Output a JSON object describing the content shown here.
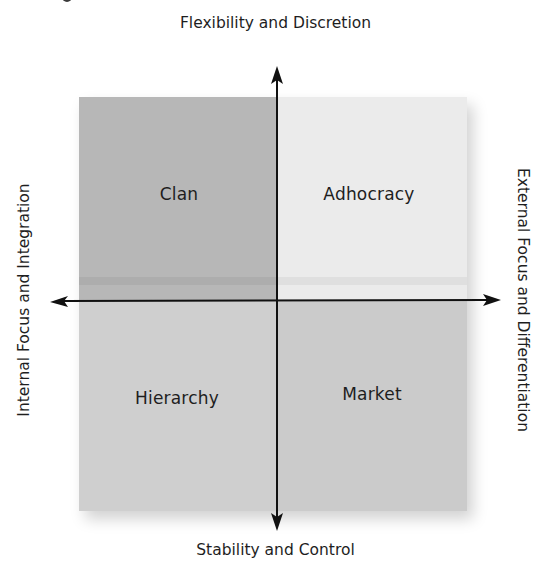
{
  "diagram": {
    "axes": {
      "top": "Flexibility and Discretion",
      "bottom": "Stability and Control",
      "left": "Internal Focus and Integration",
      "right": "External Focus and Differentiation"
    },
    "quadrants": {
      "top_left": {
        "label": "Clan",
        "color": "#b7b7b7"
      },
      "top_right": {
        "label": "Adhocracy",
        "color": "#ebebeb"
      },
      "bottom_left": {
        "label": "Hierarchy",
        "color": "#cfcfcf"
      },
      "bottom_right": {
        "label": "Market",
        "color": "#cbcbcb"
      }
    },
    "axis_color": "#111111"
  }
}
